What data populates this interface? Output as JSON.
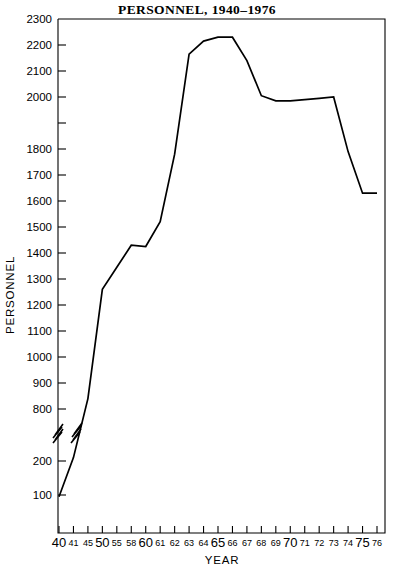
{
  "chart_data": {
    "type": "line",
    "title": "PERSONNEL,  1940–1976",
    "xlabel": "YEAR",
    "ylabel": "PERSONNEL",
    "grid": false,
    "legend": null,
    "xlim": [
      1940,
      1976
    ],
    "ylim": [
      0,
      2300
    ],
    "y_axis_break": {
      "present": true,
      "from": 300,
      "to": 800,
      "note": "axis broken between 200 and 800"
    },
    "yticks": [
      100,
      200,
      800,
      900,
      1000,
      1100,
      1200,
      1300,
      1400,
      1500,
      1600,
      1700,
      1800,
      2000,
      2100,
      2200,
      2300
    ],
    "ytick_labels": [
      "100",
      "200",
      "800",
      "900",
      "1000",
      "1100",
      "1200",
      "1300",
      "1400",
      "1500",
      "1600",
      "1700",
      "1800",
      "2000",
      "2100",
      "2200",
      "2300"
    ],
    "xticks": [
      1940,
      1941,
      1945,
      1950,
      1955,
      1958,
      1960,
      1961,
      1962,
      1963,
      1964,
      1965,
      1966,
      1967,
      1968,
      1969,
      1970,
      1971,
      1972,
      1973,
      1974,
      1975,
      1976
    ],
    "xtick_labels": [
      "40",
      "41",
      "45",
      "50",
      "55",
      "58",
      "60",
      "61",
      "62",
      "63",
      "64",
      "65",
      "66",
      "67",
      "68",
      "69",
      "70",
      "71",
      "72",
      "73",
      "74",
      "75",
      "76"
    ],
    "xtick_emphasis": [
      true,
      false,
      false,
      true,
      false,
      false,
      true,
      false,
      false,
      false,
      false,
      true,
      false,
      false,
      false,
      false,
      true,
      false,
      false,
      false,
      false,
      true,
      false
    ],
    "x": [
      1940,
      1941,
      1945,
      1950,
      1955,
      1958,
      1960,
      1961,
      1962,
      1963,
      1964,
      1965,
      1966,
      1967,
      1968,
      1969,
      1970,
      1971,
      1972,
      1973,
      1974,
      1975,
      1976
    ],
    "values": [
      95,
      210,
      840,
      1260,
      1345,
      1430,
      1425,
      1520,
      1780,
      2165,
      2215,
      2230,
      2230,
      2140,
      2005,
      1985,
      1985,
      1990,
      1995,
      2000,
      1790,
      1630,
      1630
    ],
    "series": [
      {
        "name": "Personnel",
        "color": "#000000",
        "values": [
          95,
          210,
          840,
          1260,
          1345,
          1430,
          1425,
          1520,
          1780,
          2165,
          2215,
          2230,
          2230,
          2140,
          2005,
          1985,
          1985,
          1990,
          1995,
          2000,
          1790,
          1630,
          1630
        ]
      }
    ],
    "annotations": [
      {
        "kind": "axis-break-zigzag",
        "where": "y-axis",
        "label": ""
      },
      {
        "kind": "axis-break-zigzag",
        "where": "data-line",
        "label": ""
      }
    ]
  },
  "figure": {
    "title": "PERSONNEL,  1940–1976",
    "x_axis_title": "YEAR",
    "y_axis_title": "PERSONNEL"
  }
}
